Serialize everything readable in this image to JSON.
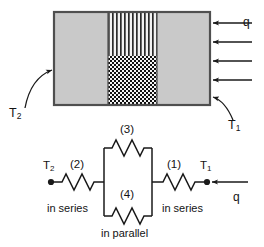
{
  "figure": {
    "colors": {
      "wall_fill": "#c9c9c9",
      "wall_stroke": "#555555",
      "stripe_dark": "#2b2b2b",
      "checker_dark": "#121212",
      "line": "#1a1a1a",
      "text": "#131313"
    }
  },
  "wall": {
    "left_section_label": "",
    "middle_top_pattern": "vertical-stripes",
    "middle_bottom_pattern": "checkerboard",
    "right_section_label": ""
  },
  "labels": {
    "T2_wall": "T",
    "T2_wall_sub": "2",
    "T1_wall": "T",
    "T1_wall_sub": "1",
    "heat_flux_wall": "q"
  },
  "network": {
    "node_left": "T",
    "node_left_sub": "2",
    "node_right": "T",
    "node_right_sub": "1",
    "heat_flux": "q",
    "resistors": [
      {
        "id": "r2",
        "label": "(2)",
        "position": "left-series"
      },
      {
        "id": "r3",
        "label": "(3)",
        "position": "parallel-top"
      },
      {
        "id": "r4",
        "label": "(4)",
        "position": "parallel-bottom"
      },
      {
        "id": "r1",
        "label": "(1)",
        "position": "right-series"
      }
    ],
    "connection_left": "in series",
    "connection_middle": "in parallel",
    "connection_right": "in series"
  }
}
